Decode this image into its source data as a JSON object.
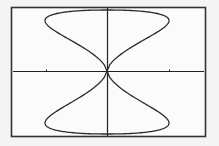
{
  "graph": {
    "type": "parametric-curve",
    "description": "Vertical figure-eight (bowtie) curve on graphing calculator screen",
    "colors": {
      "background": "#f4f4f4",
      "frame": "#333333",
      "axes": "#222222",
      "curve": "#2a2a2a"
    },
    "frame": {
      "x": 11,
      "y": 7,
      "width": 195,
      "height": 130
    },
    "origin": {
      "x": 107,
      "y": 71
    },
    "x_ticks_px": [
      46,
      169
    ],
    "curve_extent": {
      "left": 46,
      "right": 170,
      "top": 10,
      "bottom": 134
    }
  }
}
